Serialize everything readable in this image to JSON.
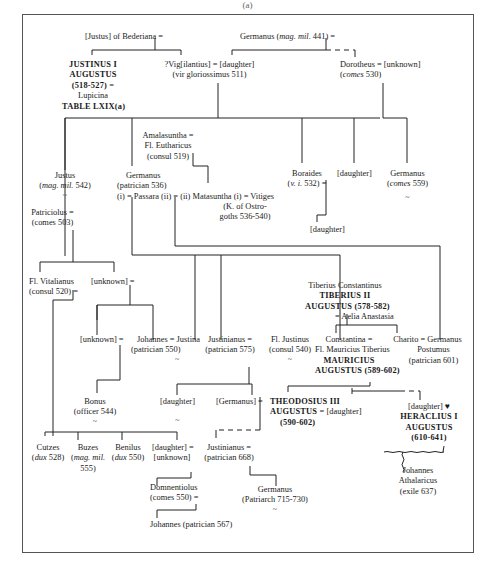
{
  "caption": "(a)",
  "people": {
    "justus_bederiana": {
      "l1": "[Justus] of  Bederiana ="
    },
    "germanus_441": {
      "pre": "Germanus (",
      "it": "mag. mil.",
      "post": " 441) ="
    },
    "justinus": {
      "l1": "JUSTINUS I",
      "l2": "AUGUSTUS",
      "l3": "(518-527) =",
      "l4": "Lupicina",
      "l5": "TABLE LXIX(a)"
    },
    "vigilantius": {
      "l1": "?Vig[ilantius] = [daughter]",
      "l2": "(vir gloriossimus 511)"
    },
    "dorotheus": {
      "l1": "Dorotheus = [unknown]",
      "l2_pre": "(",
      "l2_it": "comes",
      "l2_post": " 530)"
    },
    "amalasuntha": {
      "l1": "Amalasuntha =",
      "l2": "Fl. Eutharicus",
      "l3": "(consul 519)"
    },
    "justus_542": {
      "l1": "Justus",
      "l2_pre": "(",
      "l2_it": "mag. mil.",
      "l2_post": " 542)",
      "tilde": "~"
    },
    "germanus_536": {
      "l1": "Germanus",
      "l2": "(patrician 536)",
      "l3": "(i) = Passara (ii) = (ii) Matasuntha (i) = Vitiges"
    },
    "vitiges_note": {
      "l1": "(K. of Ostro-",
      "l2": "goths 536-540)"
    },
    "boraides": {
      "l1": "Boraides",
      "l2_pre": "(",
      "l2_it": "v. i.",
      "l2_post": " 532) ="
    },
    "daughter_top": {
      "l1": "[daughter]"
    },
    "germanus_559": {
      "l1": "Germanus",
      "l2_pre": "(",
      "l2_it": "comes",
      "l2_post": " 559)",
      "tilde": "~"
    },
    "daughter_boraides": {
      "l1": "[daughter]"
    },
    "patriciolus": {
      "l1": "Patriciolus =",
      "l2": "(comes 503)"
    },
    "vitalianus": {
      "l1": "Fl. Vitalianus",
      "l2": "(consul 520) ="
    },
    "unknown1": {
      "l1": "[unknown] ="
    },
    "unknown2": {
      "l1": "[unknown] ="
    },
    "johannes_550": {
      "l1": "Johannes = Justina",
      "l2": "(patrician 550)",
      "tilde": "~"
    },
    "justinianus_575": {
      "l1": "Justinianus =",
      "l2": "(patrician 575)"
    },
    "justinus_540": {
      "l1": "Fl. Justinus",
      "l2": "(consul 540)",
      "tilde": "~"
    },
    "tiberius": {
      "l1": "Tiberius Constantinus",
      "l2": "TIBERIUS II",
      "l3": "AUGUSTUS (578-582)",
      "l4": "= Aelia Anastasia"
    },
    "constantina": {
      "l1": "Constantina =",
      "l2": "Fl. Mauricius Tiberius",
      "l3": "MAURICIUS",
      "l4": "AUGUSTUS (589-602)"
    },
    "charito": {
      "l1": "Charito = Germanus",
      "l2": "Postumus",
      "l3": "(patrician 601)"
    },
    "bonus": {
      "l1": "Bonus",
      "l2": "(officer 544)",
      "tilde": "~"
    },
    "daughter_just": {
      "l1": "[daughter]",
      "tilde": "~"
    },
    "germanus_br": {
      "l1": "[Germanus] ="
    },
    "theodosius": {
      "l1": "THEODOSIUS III",
      "l2": "AUGUSTUS =",
      "l2b": "[daughter]",
      "l3": "(590-602)"
    },
    "heraclius": {
      "l1": "[daughter] ♥",
      "l2": "HERACLIUS I",
      "l3": "AUGUSTUS",
      "l4": "(610-641)"
    },
    "cutzes": {
      "l1": "Cutzes",
      "l2_pre": "(",
      "l2_it": "dux",
      "l2_post": " 528)"
    },
    "buzes": {
      "l1": "Buzes",
      "l2_pre": "(",
      "l2_it": "mag. mil.",
      "l3": "555)"
    },
    "benilus": {
      "l1": "Benilus",
      "l2_pre": "(",
      "l2_it": "dux",
      "l2_post": " 550)"
    },
    "daughter_unknown": {
      "l1": "[daughter] =",
      "l2": "[unknown]"
    },
    "justinianus_668": {
      "l1": "Justinianus =",
      "l2": "(patrician 668)"
    },
    "johannes_ath": {
      "l1": "Johannes",
      "l2": "Athalaricus",
      "l3": "(exile 637)"
    },
    "domnentiolus": {
      "l1": "Domnentiolus",
      "l2": "(comes 550) ="
    },
    "germanus_patriarch": {
      "l1": "Germanus",
      "l2": "(Patriarch 715-730)",
      "tilde": "~"
    },
    "johannes_567": {
      "l1": "Johannes (patrician  567)"
    }
  }
}
